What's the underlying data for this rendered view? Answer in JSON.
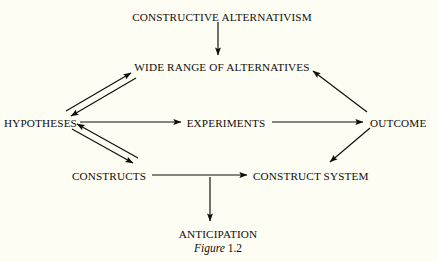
{
  "figure": {
    "caption_word": "Figure",
    "caption_number": "1.2",
    "background_color": "#fdfdf4",
    "ink_color": "#100c08"
  },
  "nodes": [
    {
      "id": "constructive-alternativism",
      "label": "CONSTRUCTIVE ALTERNATIVISM",
      "x": 222,
      "y": 12,
      "align": "center"
    },
    {
      "id": "wide-range-of-alternatives",
      "label": "WIDE RANGE OF ALTERNATIVES",
      "x": 222,
      "y": 62,
      "align": "center"
    },
    {
      "id": "hypotheses",
      "label": "HYPOTHESES",
      "x": 4,
      "y": 118,
      "align": "left"
    },
    {
      "id": "experiments",
      "label": "EXPERIMENTS",
      "x": 226,
      "y": 118,
      "align": "center"
    },
    {
      "id": "outcome",
      "label": "OUTCOME",
      "x": 370,
      "y": 118,
      "align": "left"
    },
    {
      "id": "constructs",
      "label": "CONSTRUCTS",
      "x": 109,
      "y": 171,
      "align": "center"
    },
    {
      "id": "construct-system",
      "label": "CONSTRUCT SYSTEM",
      "x": 253,
      "y": 171,
      "align": "left"
    },
    {
      "id": "anticipation",
      "label": "ANTICIPATION",
      "x": 218,
      "y": 229,
      "align": "center"
    }
  ],
  "edges": [
    {
      "id": "constructive-alternativism-to-wide-range",
      "from": "constructive-alternativism",
      "to": "wide-range-of-alternatives",
      "style": "single",
      "direction": "down"
    },
    {
      "id": "hypotheses-to-wide-range",
      "from": "hypotheses",
      "to": "wide-range-of-alternatives",
      "style": "double",
      "direction": "up-right"
    },
    {
      "id": "hypotheses-to-experiments",
      "from": "hypotheses",
      "to": "experiments",
      "style": "single",
      "direction": "right"
    },
    {
      "id": "experiments-to-outcome",
      "from": "experiments",
      "to": "outcome",
      "style": "single",
      "direction": "right"
    },
    {
      "id": "outcome-to-wide-range",
      "from": "outcome",
      "to": "wide-range-of-alternatives",
      "style": "single",
      "direction": "up-left"
    },
    {
      "id": "hypotheses-to-constructs",
      "from": "hypotheses",
      "to": "constructs",
      "style": "double",
      "direction": "down-right"
    },
    {
      "id": "constructs-to-construct-system",
      "from": "constructs",
      "to": "construct-system",
      "style": "single",
      "direction": "right"
    },
    {
      "id": "outcome-to-construct-system",
      "from": "outcome",
      "to": "construct-system",
      "style": "single",
      "direction": "down-left"
    },
    {
      "id": "construct-system-to-anticipation",
      "from": "constructs",
      "to": "anticipation",
      "style": "single",
      "direction": "down"
    }
  ]
}
